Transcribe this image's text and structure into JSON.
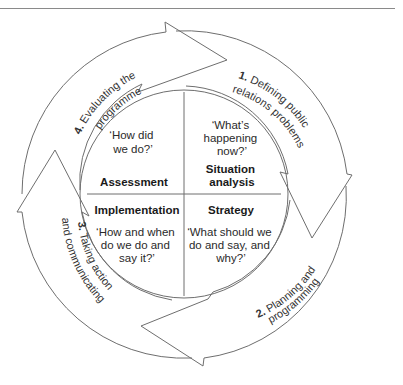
{
  "diagram": {
    "stages": [
      {
        "number": "1.",
        "line1": "Defining public",
        "line2": "relations problems"
      },
      {
        "number": "2.",
        "line1": "Planning and",
        "line2": "programming"
      },
      {
        "number": "3.",
        "line1": "Taking action",
        "line2": "and communicating"
      },
      {
        "number": "4.",
        "line1": "Evaluating the",
        "line2": "programme"
      }
    ],
    "quadrants": {
      "top_left": {
        "question_line1": "‘How did",
        "question_line2": "we do?’",
        "label": "Assessment"
      },
      "top_right": {
        "question_line1": "‘What’s",
        "question_line2": "happening",
        "question_line3": "now?’",
        "label_line1": "Situation",
        "label_line2": "analysis"
      },
      "bottom_left": {
        "label": "Implementation",
        "question_line1": "‘How and when",
        "question_line2": "do we do and",
        "question_line3": "say it?’"
      },
      "bottom_right": {
        "label": "Strategy",
        "question_line1": "‘What should we",
        "question_line2": "do and say, and",
        "question_line3": "why?’"
      }
    },
    "colors": {
      "stroke": "#6e6e6e",
      "background": "#ffffff"
    }
  }
}
